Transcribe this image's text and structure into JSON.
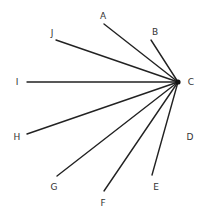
{
  "diagram": {
    "type": "radial-fan",
    "hub": {
      "label": "C",
      "x": 178,
      "y": 82,
      "label_x": 191,
      "label_y": 82
    },
    "rays": [
      {
        "label": "A",
        "x1": 104,
        "y1": 24,
        "label_x": 103,
        "label_y": 16
      },
      {
        "label": "B",
        "x1": 151,
        "y1": 40,
        "label_x": 155,
        "label_y": 32
      },
      {
        "label": "J",
        "x1": 56,
        "y1": 40,
        "label_x": 52,
        "label_y": 33
      },
      {
        "label": "I",
        "x1": 27,
        "y1": 82,
        "label_x": 17,
        "label_y": 82
      },
      {
        "label": "H",
        "x1": 27,
        "y1": 134,
        "label_x": 17,
        "label_y": 137
      },
      {
        "label": "G",
        "x1": 57,
        "y1": 176,
        "label_x": 54,
        "label_y": 187
      },
      {
        "label": "F",
        "x1": 104,
        "y1": 191,
        "label_x": 103,
        "label_y": 203
      },
      {
        "label": "E",
        "x1": 152,
        "y1": 175,
        "label_x": 156,
        "label_y": 187
      }
    ],
    "isolated_points": [
      {
        "label": "D",
        "label_x": 190,
        "label_y": 137
      }
    ]
  }
}
